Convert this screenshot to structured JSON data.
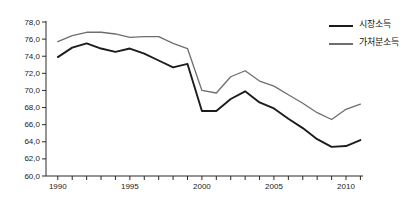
{
  "chart_data": {
    "type": "line",
    "title": "",
    "xlabel": "",
    "ylabel": "",
    "xlim": [
      1989,
      2011
    ],
    "ylim": [
      60.0,
      78.0
    ],
    "ytick_step": 2.0,
    "decimal_separator": ",",
    "grid": false,
    "legend_position": "top-right",
    "x": [
      1990,
      1991,
      1992,
      1993,
      1994,
      1995,
      1996,
      1997,
      1998,
      1999,
      2000,
      2001,
      2002,
      2003,
      2004,
      2005,
      2006,
      2007,
      2008,
      2009,
      2010,
      2011
    ],
    "xticks": [
      1990,
      1991,
      1992,
      1993,
      1994,
      1995,
      1996,
      1997,
      1998,
      1999,
      2000,
      2001,
      2002,
      2003,
      2004,
      2005,
      2006,
      2007,
      2008,
      2009,
      2010,
      2011
    ],
    "xtick_labels": [
      "1990",
      "",
      "",
      "",
      "",
      "1995",
      "",
      "",
      "",
      "",
      "2000",
      "",
      "",
      "",
      "",
      "2005",
      "",
      "",
      "",
      "",
      "2010",
      ""
    ],
    "yticks": [
      60.0,
      62.0,
      64.0,
      66.0,
      68.0,
      70.0,
      72.0,
      74.0,
      76.0,
      78.0
    ],
    "ytick_labels": [
      "60,0",
      "62,0",
      "64,0",
      "66,0",
      "68,0",
      "70,0",
      "72,0",
      "74,0",
      "76,0",
      "78,0"
    ],
    "series": [
      {
        "name": "시장소득",
        "color": "#1c1c1c",
        "line_width": 1.9,
        "values": [
          73.9,
          75.0,
          75.5,
          74.9,
          74.5,
          74.9,
          74.3,
          73.5,
          72.7,
          73.1,
          67.6,
          67.6,
          69.0,
          69.9,
          68.6,
          67.9,
          66.7,
          65.6,
          64.3,
          63.4,
          63.5,
          64.2
        ]
      },
      {
        "name": "가처분소득",
        "color": "#6e6e6e",
        "line_width": 1.3,
        "values": [
          75.7,
          76.4,
          76.8,
          76.8,
          76.6,
          76.2,
          76.3,
          76.3,
          75.5,
          74.9,
          70.0,
          69.7,
          71.6,
          72.3,
          71.1,
          70.5,
          69.5,
          68.5,
          67.4,
          66.6,
          67.8,
          68.4
        ]
      }
    ]
  },
  "legend": {
    "items": [
      {
        "label": "시장소득",
        "color": "#1c1c1c",
        "line_width": 2.4
      },
      {
        "label": "가처분소득",
        "color": "#6e6e6e",
        "line_width": 1.5
      }
    ]
  }
}
